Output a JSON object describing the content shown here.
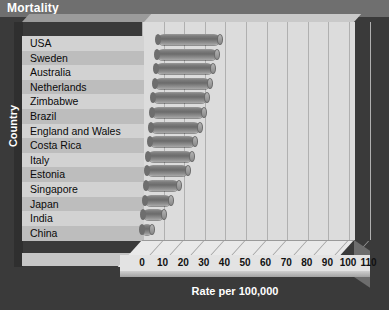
{
  "title": "Mortality",
  "axis": {
    "ylabel": "Country",
    "xlabel": "Rate per 100,000"
  },
  "chart_data": {
    "type": "bar",
    "orientation": "horizontal",
    "title": "Mortality",
    "xlabel": "Rate per 100,000",
    "ylabel": "Country",
    "xlim": [
      0,
      110
    ],
    "xticks": [
      0,
      10,
      20,
      30,
      40,
      50,
      60,
      70,
      80,
      90,
      100,
      110
    ],
    "grid": true,
    "legend": false,
    "style": "3d-cylinder",
    "categories": [
      "USA",
      "Sweden",
      "Australia",
      "Netherlands",
      "Zimbabwe",
      "Brazil",
      "England and Wales",
      "Costa Rica",
      "Italy",
      "Estonia",
      "Singapore",
      "Japan",
      "India",
      "China"
    ],
    "values": [
      30,
      29,
      28,
      27,
      26,
      25,
      24,
      22,
      21,
      20,
      16,
      13,
      10,
      5
    ]
  },
  "tick_labels": [
    "0",
    "10",
    "20",
    "30",
    "40",
    "50",
    "60",
    "70",
    "80",
    "90",
    "100",
    "110"
  ]
}
